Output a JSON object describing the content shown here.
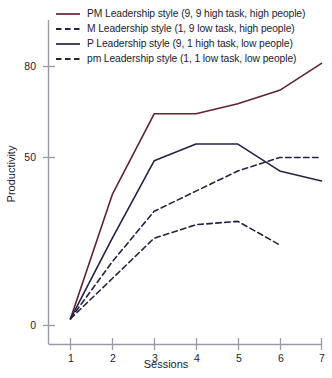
{
  "chart_data": {
    "type": "line",
    "title": "",
    "xlabel": "Sessions",
    "ylabel": "Productivity",
    "x": [
      1,
      2,
      3,
      4,
      5,
      6,
      7
    ],
    "categories": [
      "1",
      "2",
      "3",
      "4",
      "5",
      "6",
      "7"
    ],
    "xlim": [
      0.6,
      7.25
    ],
    "ylim": [
      0,
      86
    ],
    "yticks": [
      0,
      50,
      80
    ],
    "ytick_labels": [
      "0",
      "50",
      "80"
    ],
    "xtick_labels": [
      "1",
      "2",
      "3",
      "4",
      "5",
      "6",
      "7"
    ],
    "grid": false,
    "legend_position": "top-left",
    "series": [
      {
        "name": "PM Leadership style (9, 9 high task, high people)",
        "style": "solid",
        "color": "#5e2430",
        "x": [
          1,
          2,
          3,
          4,
          5,
          6,
          7
        ],
        "values": [
          2,
          39,
          63,
          63,
          66,
          70,
          78
        ]
      },
      {
        "name": "M Leadership style (1, 9 low task, high people)",
        "style": "dashed",
        "color": "#242442",
        "x": [
          1,
          2,
          3,
          4,
          5,
          6,
          7
        ],
        "values": [
          2,
          19,
          34,
          40,
          46,
          50,
          50
        ]
      },
      {
        "name": "P Leadership style (9, 1 high task, low people)",
        "style": "solid",
        "color": "#242442",
        "x": [
          1,
          2,
          3,
          4,
          5,
          6,
          7
        ],
        "values": [
          2,
          26,
          49,
          54,
          54,
          46,
          43
        ]
      },
      {
        "name": "pm Leadership style (1, 1 low task, low people)",
        "style": "dashed",
        "color": "#242442",
        "x": [
          1,
          2,
          3,
          4,
          5,
          6
        ],
        "values": [
          2,
          14,
          26,
          30,
          31,
          24
        ]
      }
    ]
  },
  "legend": {
    "items": [
      {
        "label": "PM Leadership style (9, 9 high task, high people)",
        "style": "solid",
        "color": "#5e2430"
      },
      {
        "label": "M Leadership style (1, 9 low task, high people)",
        "style": "dashed",
        "color": "#242442"
      },
      {
        "label": "P Leadership style (9, 1 high task, low people)",
        "style": "solid",
        "color": "#242442"
      },
      {
        "label": "pm Leadership style (1, 1 low task, low people)",
        "style": "dashed",
        "color": "#242442"
      }
    ]
  },
  "axes": {
    "y_title": "Productivity",
    "x_title": "Sessions",
    "y_tick_0": "0",
    "y_tick_50": "50",
    "y_tick_80": "80",
    "x_tick_1": "1",
    "x_tick_2": "2",
    "x_tick_3": "3",
    "x_tick_4": "4",
    "x_tick_5": "5",
    "x_tick_6": "6",
    "x_tick_7": "7"
  },
  "colors": {
    "axis": "#9a9aa8",
    "pm_series": "#5e2430",
    "navy_series": "#242442",
    "text": "#1c1c32"
  }
}
